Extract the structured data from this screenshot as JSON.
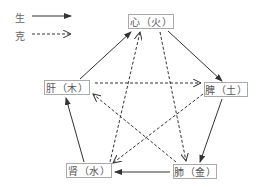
{
  "legend": {
    "generate_label": "生",
    "restrain_label": "克"
  },
  "nodes": {
    "heart": "心（火）",
    "spleen": "脾（土）",
    "lung": "肺（金）",
    "kidney": "肾（水）",
    "liver": "肝（木）"
  },
  "relations": {
    "generate": [
      [
        "肝",
        "心"
      ],
      [
        "心",
        "脾"
      ],
      [
        "脾",
        "肺"
      ],
      [
        "肺",
        "肾"
      ],
      [
        "肾",
        "肝"
      ]
    ],
    "restrain": [
      [
        "肝",
        "脾"
      ],
      [
        "脾",
        "肾"
      ],
      [
        "肾",
        "心"
      ],
      [
        "心",
        "肺"
      ],
      [
        "肺",
        "肝"
      ]
    ]
  },
  "colors": {
    "line": "#333333",
    "box_border": "#aaaaaa",
    "text": "#555555"
  }
}
